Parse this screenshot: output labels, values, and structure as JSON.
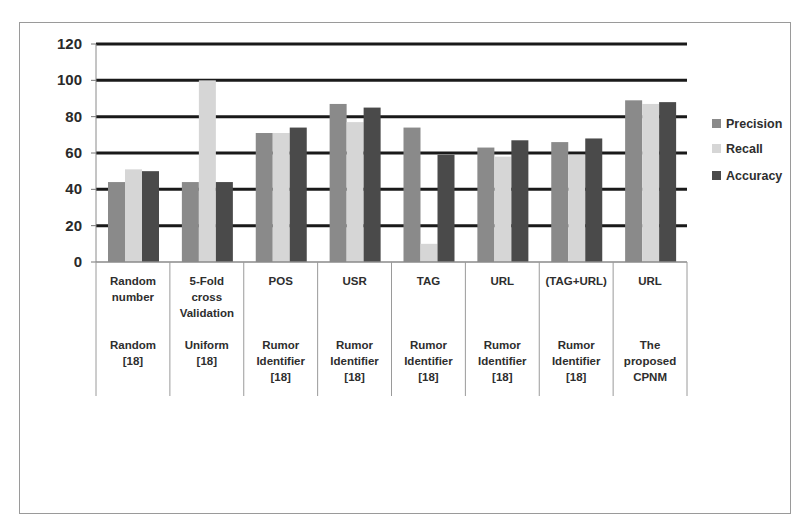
{
  "chart_data": {
    "type": "bar",
    "title": "",
    "xlabel": "",
    "ylabel": "",
    "ylim": [
      0,
      120
    ],
    "yticks": [
      0,
      20,
      40,
      60,
      80,
      100,
      120
    ],
    "grid": true,
    "legend_position": "right",
    "categories": [
      {
        "feature": [
          "Random",
          "number"
        ],
        "method": [
          "Random",
          "[18]"
        ]
      },
      {
        "feature": [
          "5-Fold",
          "cross",
          "Validation"
        ],
        "method": [
          "Uniform",
          "[18]"
        ]
      },
      {
        "feature": [
          "POS"
        ],
        "method": [
          "Rumor",
          "Identifier",
          "[18]"
        ]
      },
      {
        "feature": [
          "USR"
        ],
        "method": [
          "Rumor",
          "Identifier",
          "[18]"
        ]
      },
      {
        "feature": [
          "TAG"
        ],
        "method": [
          "Rumor",
          "Identifier",
          "[18]"
        ]
      },
      {
        "feature": [
          "URL"
        ],
        "method": [
          "Rumor",
          "Identifier",
          "[18]"
        ]
      },
      {
        "feature": [
          "(TAG+URL)"
        ],
        "method": [
          "Rumor",
          "Identifier",
          "[18]"
        ]
      },
      {
        "feature": [
          "URL"
        ],
        "method": [
          "The",
          "proposed",
          "CPNM"
        ]
      }
    ],
    "series": [
      {
        "name": "Precision",
        "color": "#8a8a8a",
        "values": [
          44,
          44,
          71,
          87,
          74,
          63,
          66,
          89
        ]
      },
      {
        "name": "Recall",
        "color": "#d6d6d6",
        "values": [
          51,
          100,
          71,
          77,
          10,
          58,
          59,
          87
        ]
      },
      {
        "name": "Accuracy",
        "color": "#4a4a4a",
        "values": [
          50,
          44,
          74,
          85,
          59,
          67,
          68,
          88
        ]
      }
    ]
  }
}
